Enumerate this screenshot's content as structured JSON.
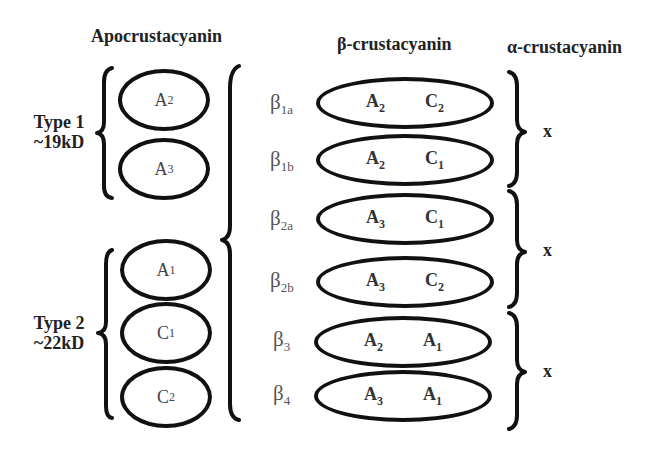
{
  "titles": {
    "apo": "Apocrustacyanin",
    "beta": "β-crustacyanin",
    "alpha": "α-crustacyanin"
  },
  "types": [
    {
      "line1": "Type 1",
      "line2": "~19kD"
    },
    {
      "line1": "Type 2",
      "line2": "~22kD"
    }
  ],
  "apo_subunits": [
    {
      "base": "A",
      "sub": "2"
    },
    {
      "base": "A",
      "sub": "3"
    },
    {
      "base": "A",
      "sub": "1"
    },
    {
      "base": "C",
      "sub": "1"
    },
    {
      "base": "C",
      "sub": "2"
    }
  ],
  "beta_dimers": [
    {
      "label": "β",
      "label_sub": "1a",
      "left": {
        "base": "A",
        "sub": "2"
      },
      "right": {
        "base": "C",
        "sub": "2"
      }
    },
    {
      "label": "β",
      "label_sub": "1b",
      "left": {
        "base": "A",
        "sub": "2"
      },
      "right": {
        "base": "C",
        "sub": "1"
      }
    },
    {
      "label": "β",
      "label_sub": "2a",
      "left": {
        "base": "A",
        "sub": "3"
      },
      "right": {
        "base": "C",
        "sub": "1"
      }
    },
    {
      "label": "β",
      "label_sub": "2b",
      "left": {
        "base": "A",
        "sub": "3"
      },
      "right": {
        "base": "C",
        "sub": "2"
      }
    },
    {
      "label": "β",
      "label_sub": "3",
      "left": {
        "base": "A",
        "sub": "2"
      },
      "right": {
        "base": "A",
        "sub": "1"
      }
    },
    {
      "label": "β",
      "label_sub": "4",
      "left": {
        "base": "A",
        "sub": "3"
      },
      "right": {
        "base": "A",
        "sub": "1"
      }
    }
  ],
  "alpha_groups": [
    {
      "mark": "x"
    },
    {
      "mark": "x"
    },
    {
      "mark": "x"
    }
  ]
}
